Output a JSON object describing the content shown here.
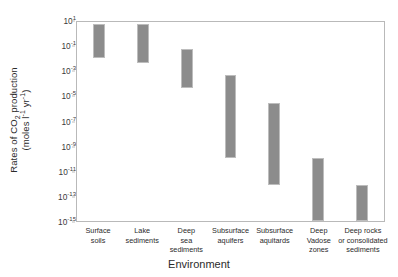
{
  "chart_data": {
    "type": "bar",
    "title": "",
    "xlabel": "Environment",
    "ylabel_line1": "Rates of CO2 production",
    "ylabel_line2": "(moles l-1 yr-1)",
    "grid": false,
    "legend": false,
    "scale": "log",
    "ylim": [
      1e-15,
      10
    ],
    "ytick_labels": [
      "10^1",
      "10^-1",
      "10^-3",
      "10^-5",
      "10^-7",
      "10^-9",
      "10^-11",
      "10^-13",
      "10^-15"
    ],
    "ytick_exponents": [
      1,
      -1,
      -3,
      -5,
      -7,
      -9,
      -11,
      -13,
      -15
    ],
    "categories": [
      "Surface soils",
      "Lake sediments",
      "Deep sea sediments",
      "Subsurface aquifers",
      "Subsurface aquitards",
      "Deep Vadose zones",
      "Deep rocks or consolidated sediments"
    ],
    "category_lines": [
      [
        "Surface",
        "soils"
      ],
      [
        "Lake",
        "sediments"
      ],
      [
        "Deep",
        "sea",
        "sediments"
      ],
      [
        "Subsurface",
        "aquifers"
      ],
      [
        "Subsurface",
        "aquitards"
      ],
      [
        "Deep",
        "Vadose",
        "zones"
      ],
      [
        "Deep rocks",
        "or consolidated",
        "sediments"
      ]
    ],
    "series": [
      {
        "name": "Range of CO2 production rate",
        "ranges": [
          {
            "category": "Surface soils",
            "high_exp": 0.8,
            "low_exp": -1.9
          },
          {
            "category": "Lake sediments",
            "high_exp": 0.8,
            "low_exp": -2.3
          },
          {
            "category": "Deep sea sediments",
            "high_exp": -1.2,
            "low_exp": -4.3
          },
          {
            "category": "Subsurface aquifers",
            "high_exp": -3.3,
            "low_exp": -9.9
          },
          {
            "category": "Subsurface aquitards",
            "high_exp": -5.5,
            "low_exp": -12.1
          },
          {
            "category": "Deep Vadose zones",
            "high_exp": -9.9,
            "low_exp": -15.0
          },
          {
            "category": "Deep rocks or consolidated sediments",
            "high_exp": -12.1,
            "low_exp": -15.0
          }
        ]
      }
    ],
    "colors": {
      "bar_fill": "#8c8c8c",
      "bar_edge": "#bdbdbd",
      "axis": "#b9b9b9",
      "text": "#2b2b2b",
      "background": "#ffffff"
    }
  }
}
